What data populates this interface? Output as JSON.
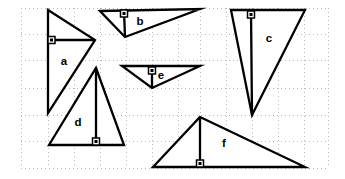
{
  "figure": {
    "width": 345,
    "height": 179,
    "background_color": "#ffffff",
    "stroke_color": "#000000",
    "grid_color": "#b9b9b9"
  },
  "grid": {
    "style": "dotted",
    "x_lines": [
      21,
      48,
      74,
      100,
      126,
      152,
      178,
      200,
      226,
      252,
      278,
      304,
      328
    ],
    "y_lines": [
      8,
      34,
      60,
      88,
      115,
      141,
      168
    ]
  },
  "shapes": [
    {
      "id": "a",
      "label": "a",
      "label_x": 64,
      "label_y": 62,
      "points": "48,10 95,40 48,113",
      "altitude": "95,40 48,40",
      "right_angle": {
        "x": 48,
        "y": 40,
        "orient": "right-of-vertical"
      }
    },
    {
      "id": "b",
      "label": "b",
      "label_x": 140,
      "label_y": 22,
      "points": "100,11 200,9 125,37",
      "altitude": "125,37 124,10",
      "right_angle": {
        "x": 124,
        "y": 10,
        "orient": "below-horizontal"
      }
    },
    {
      "id": "c",
      "label": "c",
      "label_x": 269,
      "label_y": 39,
      "points": "231,10 305,10 252,115",
      "altitude": "252,115 251,11",
      "right_angle": {
        "x": 251,
        "y": 11,
        "orient": "below-horizontal"
      }
    },
    {
      "id": "d",
      "label": "d",
      "label_x": 78,
      "label_y": 123,
      "points": "96,68 124,145 49,145",
      "altitude": "96,68 96,145",
      "right_angle": {
        "x": 96,
        "y": 145,
        "orient": "above-horizontal"
      }
    },
    {
      "id": "e",
      "label": "e",
      "label_x": 161,
      "label_y": 76,
      "points": "122,66 200,66 152,88",
      "altitude": "152,88 152,67",
      "right_angle": {
        "x": 152,
        "y": 67,
        "orient": "below-horizontal"
      }
    },
    {
      "id": "f",
      "label": "f",
      "label_x": 224,
      "label_y": 144,
      "points": "200,117 305,167 153,167",
      "altitude": "200,117 200,167",
      "right_angle": {
        "x": 200,
        "y": 167,
        "orient": "above-horizontal"
      }
    }
  ]
}
